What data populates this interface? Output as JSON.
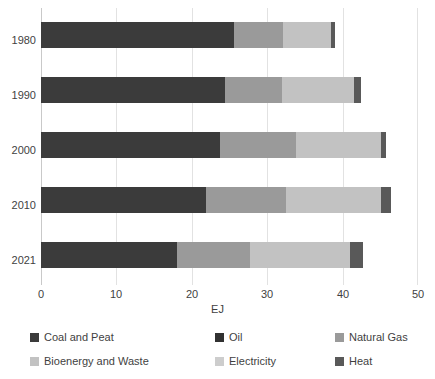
{
  "chart_data": {
    "type": "bar",
    "orientation": "horizontal",
    "stacked": true,
    "title": "",
    "xlabel": "EJ",
    "ylabel": "",
    "xlim": [
      0,
      50
    ],
    "xticks": [
      "0",
      "10",
      "20",
      "30",
      "40",
      "50"
    ],
    "xtick_values": [
      0,
      10,
      20,
      30,
      40,
      50
    ],
    "grid": true,
    "legend_position": "bottom",
    "categories": [
      "1980",
      "1990",
      "2000",
      "2010",
      "2021"
    ],
    "series": [
      {
        "name": "Coal and Peat",
        "color": "#3b3b3b",
        "values": [
          25.6,
          24.4,
          23.7,
          21.9,
          18.0
        ]
      },
      {
        "name": "Oil",
        "color": "#313131",
        "values": [
          0.0,
          0.0,
          0.0,
          0.0,
          0.0
        ]
      },
      {
        "name": "Natural Gas",
        "color": "#9a9a9a",
        "values": [
          6.5,
          7.6,
          10.1,
          10.6,
          9.7
        ]
      },
      {
        "name": "Bioenergy and Waste",
        "color": "#c2c2c2",
        "values": [
          6.4,
          9.5,
          11.3,
          12.6,
          13.3
        ]
      },
      {
        "name": "Electricity",
        "color": "#cdcdcd",
        "values": [
          0.0,
          0.0,
          0.0,
          0.0,
          0.0
        ]
      },
      {
        "name": "Heat",
        "color": "#595959",
        "values": [
          0.5,
          0.9,
          0.7,
          1.3,
          1.7
        ]
      }
    ],
    "totals": [
      39.0,
      42.4,
      45.8,
      46.4,
      42.7
    ]
  },
  "legend": {
    "items": [
      {
        "label": "Coal and Peat",
        "color": "#3b3b3b"
      },
      {
        "label": "Oil",
        "color": "#313131"
      },
      {
        "label": "Natural Gas",
        "color": "#9a9a9a"
      },
      {
        "label": "Bioenergy and Waste",
        "color": "#c2c2c2"
      },
      {
        "label": "Electricity",
        "color": "#cdcdcd"
      },
      {
        "label": "Heat",
        "color": "#595959"
      }
    ]
  },
  "axis": {
    "x_title": "EJ"
  }
}
